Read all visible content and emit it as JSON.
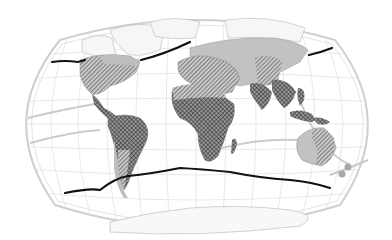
{
  "map": {
    "projection": "winkel-tripel-world",
    "background": "#ffffff",
    "colors": {
      "frame": "#c4c4c4",
      "graticule": "#dedede",
      "coastline": "#b8b8b8",
      "land_light": "#f4f4f4",
      "land_grey": "#bdbdbd",
      "hatch_diagonal": "#5a5a5a",
      "hatch_cross": "#3a3a3a",
      "boundary_line": "#111111",
      "isoline": "#cfcfcf"
    },
    "legend": [
      {
        "id": "crosshatch",
        "pattern": "cross-hatched dark"
      },
      {
        "id": "diagonal",
        "pattern": "diagonal-hatched"
      },
      {
        "id": "grey",
        "pattern": "solid grey fill"
      }
    ],
    "layers": {
      "north_boundary": "thick black line across northern hemisphere",
      "south_boundary": "thick black line across southern hemisphere",
      "isolines": "light grey curves in oceans"
    }
  }
}
